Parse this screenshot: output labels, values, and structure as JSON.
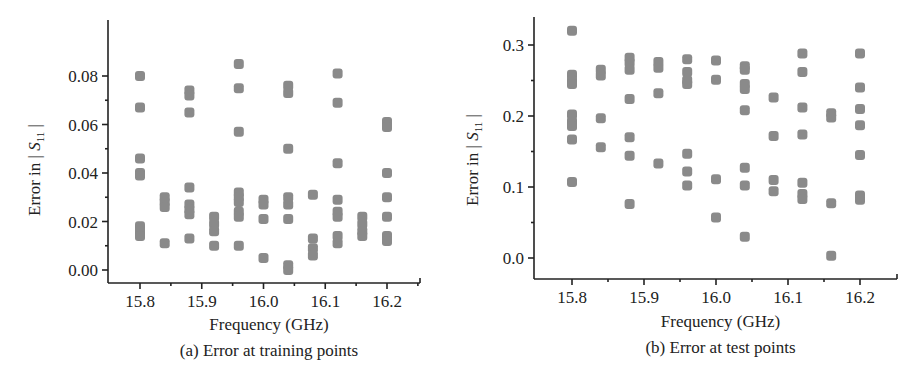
{
  "chart_data": [
    {
      "id": "a",
      "type": "scatter",
      "title": "",
      "caption": "(a) Error at training points",
      "xlabel": "Frequency (GHz)",
      "ylabel_prefix": "Error in ",
      "ylabel_symbol": "S",
      "ylabel_subscript": "11",
      "xlim": [
        15.74,
        16.25
      ],
      "ylim": [
        -0.004,
        0.1
      ],
      "xticks": [
        15.8,
        15.9,
        16.0,
        16.1,
        16.2
      ],
      "xtick_labels": [
        "15.8",
        "15.9",
        "16.0",
        "16.1",
        "16.2"
      ],
      "xminor": [
        15.85,
        15.95,
        16.05,
        16.15,
        16.25
      ],
      "yticks": [
        0.0,
        0.02,
        0.04,
        0.06,
        0.08
      ],
      "ytick_labels": [
        "0.00",
        "0.02",
        "0.04",
        "0.06",
        "0.08"
      ],
      "yminor": [
        0.01,
        0.03,
        0.05,
        0.07
      ],
      "grid": false,
      "legend": null,
      "marker_color": "#8a8a8a",
      "points": [
        {
          "x": 15.8,
          "y": [
            0.08,
            0.067,
            0.046,
            0.04,
            0.039,
            0.018,
            0.016,
            0.014
          ]
        },
        {
          "x": 15.84,
          "y": [
            0.03,
            0.028,
            0.026,
            0.011
          ]
        },
        {
          "x": 15.88,
          "y": [
            0.074,
            0.072,
            0.065,
            0.034,
            0.027,
            0.025,
            0.023,
            0.013
          ]
        },
        {
          "x": 15.92,
          "y": [
            0.022,
            0.019,
            0.016,
            0.01
          ]
        },
        {
          "x": 15.96,
          "y": [
            0.085,
            0.075,
            0.057,
            0.032,
            0.03,
            0.028,
            0.024,
            0.022,
            0.01
          ]
        },
        {
          "x": 16.0,
          "y": [
            0.029,
            0.027,
            0.021,
            0.005
          ]
        },
        {
          "x": 16.04,
          "y": [
            0.076,
            0.073,
            0.05,
            0.03,
            0.027,
            0.021,
            0.002,
            0.0
          ]
        },
        {
          "x": 16.08,
          "y": [
            0.031,
            0.013,
            0.009,
            0.006
          ]
        },
        {
          "x": 16.12,
          "y": [
            0.081,
            0.069,
            0.044,
            0.029,
            0.024,
            0.022,
            0.014,
            0.011
          ]
        },
        {
          "x": 16.16,
          "y": [
            0.022,
            0.019,
            0.016,
            0.014
          ]
        },
        {
          "x": 16.2,
          "y": [
            0.061,
            0.059,
            0.04,
            0.03,
            0.022,
            0.014,
            0.012
          ]
        }
      ]
    },
    {
      "id": "b",
      "type": "scatter",
      "title": "",
      "caption": "(b) Error at test points",
      "xlabel": "Frequency (GHz)",
      "ylabel_prefix": "Error in ",
      "ylabel_symbol": "S",
      "ylabel_subscript": "11",
      "xlim": [
        15.75,
        16.25
      ],
      "ylim": [
        -0.03,
        0.34
      ],
      "xticks": [
        15.8,
        15.9,
        16.0,
        16.1,
        16.2
      ],
      "xtick_labels": [
        "15.8",
        "15.9",
        "16.0",
        "16.1",
        "16.2"
      ],
      "xminor": [
        15.85,
        15.95,
        16.05,
        16.15,
        16.25
      ],
      "yticks": [
        0.0,
        0.1,
        0.2,
        0.3
      ],
      "ytick_labels": [
        "0.0",
        "0.1",
        "0.2",
        "0.3"
      ],
      "yminor": [
        0.05,
        0.15,
        0.25
      ],
      "grid": false,
      "legend": null,
      "marker_color": "#8a8a8a",
      "points": [
        {
          "x": 15.8,
          "y": [
            0.32,
            0.258,
            0.25,
            0.245,
            0.202,
            0.192,
            0.186,
            0.167,
            0.107
          ]
        },
        {
          "x": 15.84,
          "y": [
            0.265,
            0.257,
            0.197,
            0.156
          ]
        },
        {
          "x": 15.88,
          "y": [
            0.282,
            0.275,
            0.265,
            0.224,
            0.17,
            0.144,
            0.076
          ]
        },
        {
          "x": 15.92,
          "y": [
            0.276,
            0.268,
            0.232,
            0.133
          ]
        },
        {
          "x": 15.96,
          "y": [
            0.28,
            0.262,
            0.25,
            0.245,
            0.147,
            0.122,
            0.102
          ]
        },
        {
          "x": 16.0,
          "y": [
            0.278,
            0.251,
            0.111,
            0.057
          ]
        },
        {
          "x": 16.04,
          "y": [
            0.27,
            0.265,
            0.245,
            0.238,
            0.208,
            0.127,
            0.102,
            0.03
          ]
        },
        {
          "x": 16.08,
          "y": [
            0.226,
            0.172,
            0.11,
            0.094
          ]
        },
        {
          "x": 16.12,
          "y": [
            0.288,
            0.262,
            0.212,
            0.174,
            0.106,
            0.09,
            0.083
          ]
        },
        {
          "x": 16.16,
          "y": [
            0.204,
            0.198,
            0.077,
            0.003
          ]
        },
        {
          "x": 16.2,
          "y": [
            0.288,
            0.24,
            0.21,
            0.187,
            0.145,
            0.088,
            0.082
          ]
        }
      ]
    }
  ],
  "layout": {
    "panels": [
      {
        "axis_x": 108,
        "axis_top": 20,
        "axis_bottom": 283,
        "axis_right": 420,
        "x0_val": 15.8,
        "x0_px": 140,
        "px_per_unit_x": 617.5,
        "y0_val": 0.0,
        "y0_px": 270,
        "px_per_unit_y": 2425,
        "xlabel_y": 330,
        "caption_y": 356,
        "ylabel_x": 40,
        "ylabel_cy": 170
      },
      {
        "axis_x": 534,
        "axis_top": 17,
        "axis_bottom": 279,
        "axis_right": 897,
        "x0_val": 15.8,
        "x0_px": 572,
        "px_per_unit_x": 720,
        "y0_val": 0.0,
        "y0_px": 258,
        "px_per_unit_y": 710,
        "xlabel_y": 327,
        "caption_y": 353,
        "ylabel_x": 478,
        "ylabel_cy": 160
      }
    ]
  }
}
